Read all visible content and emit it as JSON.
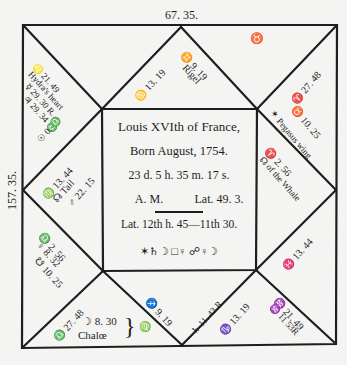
{
  "chart": {
    "top_degree": "67. 35.",
    "left_degree": "157. 35.",
    "colors": {
      "ink": "#1e1e1e",
      "paper": "#f4f4f2"
    }
  },
  "center": {
    "title": "Louis XVIth of France,",
    "born": "Born August, 1754.",
    "time": "23 d.  5 h.  35 m.  17 s.",
    "am": "A. M.",
    "lat": "Lat. 49. 3.",
    "houses": "Lat. 12th h.  45—11th 30.",
    "aspects": "✶♄☽  □♀  ☍♀☽"
  },
  "houses": {
    "h12_upper_left": [
      "♌ 21. 49",
      "Hydra's heart",
      "☿ 29. 30 R.",
      "♃ 29. 34 ♎",
      "☉ 0. ♎"
    ],
    "h11_top_left_tri": [
      "♋ 13. 19"
    ],
    "h10_top_tri": [
      "♊ 9. 19",
      "Rigel"
    ],
    "h9_top_right_tri": [
      "♉"
    ],
    "h8_upper_right": [
      "♈ 27. 48",
      "♉ 10. 25",
      "✶ Pegasus wing"
    ],
    "h7_right_tri": [
      "♈ 2. 56",
      "☊ of the Whale"
    ],
    "h6_right_lower_tri": [
      "♓ 13. 44"
    ],
    "h5_lower_right": [
      "♒ 21. 49",
      "♒ 11 53R"
    ],
    "h4_bottom_right_tri": [
      "♑ 13. 19"
    ],
    "h3_bottom_tri": [
      "♐ 9. 19",
      "♄ 11. 43 R."
    ],
    "h2_lower_left": [
      "♎ 27. 48",
      "☽ 8. 30",
      "Chalœ",
      "♍"
    ],
    "h1_left_tri": [
      "♎ 2. 56",
      "♀ 8. 32",
      "☋ 10. 25"
    ],
    "h12b_left_upper_tri": [
      "♍ 13. 44",
      "☊ Tail",
      "♂ 22. 15"
    ]
  }
}
